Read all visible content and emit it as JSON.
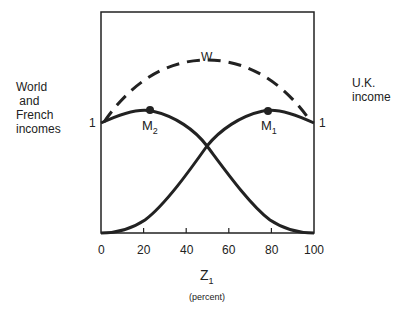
{
  "diagram": {
    "left_axis_label": [
      "World",
      " and",
      "French",
      "incomes"
    ],
    "right_axis_label": [
      "U.K.",
      "income"
    ],
    "left_value": "1",
    "right_value": "1",
    "curve_w_label": "W",
    "point_m1": {
      "base": "M",
      "sub": "1"
    },
    "point_m2": {
      "base": "M",
      "sub": "2"
    },
    "x_ticks": [
      "0",
      "20",
      "40",
      "60",
      "80",
      "100"
    ],
    "x_axis": {
      "base": "Z",
      "sub": "1",
      "unit": "(percent)"
    }
  }
}
